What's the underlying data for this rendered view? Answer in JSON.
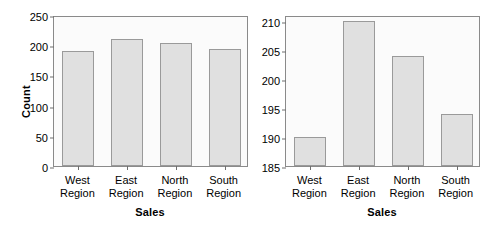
{
  "chart_data": [
    {
      "type": "bar",
      "panel": "left",
      "title": "",
      "categories": [
        "West Region",
        "East Region",
        "North Region",
        "South Region"
      ],
      "category_lines": [
        [
          "West",
          "Region"
        ],
        [
          "East",
          "Region"
        ],
        [
          "North",
          "Region"
        ],
        [
          "South",
          "Region"
        ]
      ],
      "values": [
        190,
        210,
        204,
        194
      ],
      "xlabel": "Sales",
      "ylabel": "Count",
      "ylim": [
        0,
        250
      ],
      "yticks": [
        0,
        50,
        100,
        150,
        200,
        250
      ],
      "grid": false,
      "legend": "none",
      "bar_color": "#e0e0e0",
      "bar_edge_color": "#9a9a9a"
    },
    {
      "type": "bar",
      "panel": "right",
      "title": "",
      "categories": [
        "West Region",
        "East Region",
        "North Region",
        "South Region"
      ],
      "category_lines": [
        [
          "West",
          "Region"
        ],
        [
          "East",
          "Region"
        ],
        [
          "North",
          "Region"
        ],
        [
          "South",
          "Region"
        ]
      ],
      "values": [
        190,
        210,
        204,
        194
      ],
      "xlabel": "Sales",
      "ylabel": "",
      "ylim": [
        185,
        211
      ],
      "yticks": [
        185,
        190,
        195,
        200,
        205,
        210
      ],
      "grid": false,
      "legend": "none",
      "bar_color": "#e0e0e0",
      "bar_edge_color": "#9a9a9a"
    }
  ],
  "left": {
    "ylabel": "Count",
    "xlabel": "Sales",
    "yticks": [
      "0",
      "50",
      "100",
      "150",
      "200",
      "250"
    ],
    "xticks": [
      {
        "line1": "West",
        "line2": "Region"
      },
      {
        "line1": "East",
        "line2": "Region"
      },
      {
        "line1": "North",
        "line2": "Region"
      },
      {
        "line1": "South",
        "line2": "Region"
      }
    ]
  },
  "right": {
    "ylabel": "",
    "xlabel": "Sales",
    "yticks": [
      "185",
      "190",
      "195",
      "200",
      "205",
      "210"
    ],
    "xticks": [
      {
        "line1": "West",
        "line2": "Region"
      },
      {
        "line1": "East",
        "line2": "Region"
      },
      {
        "line1": "North",
        "line2": "Region"
      },
      {
        "line1": "South",
        "line2": "Region"
      }
    ]
  }
}
